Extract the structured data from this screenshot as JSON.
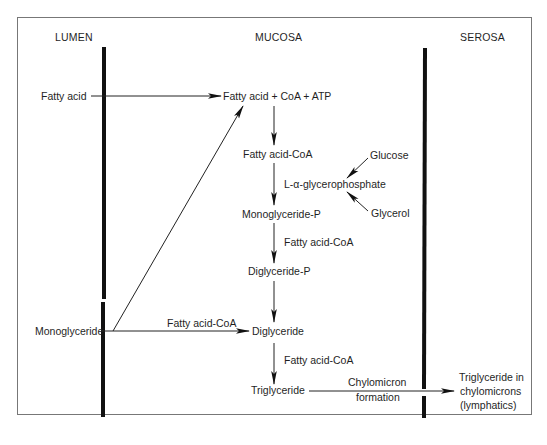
{
  "diagram": {
    "compartments": {
      "lumen": "LUMEN",
      "mucosa": "MUCOSA",
      "serosa": "SEROSA"
    },
    "nodes": {
      "fatty_acid_lumen": "Fatty acid",
      "monoglyceride_lumen": "Monoglyceride",
      "activation": "Fatty acid + CoA + ATP",
      "fatty_acid_coa": "Fatty acid-CoA",
      "glycerophosphate": "L-α-glycerophosphate",
      "glucose": "Glucose",
      "glycerol": "Glycerol",
      "monoglyceride_p": "Monoglyceride-P",
      "diglyceride_p": "Diglyceride-P",
      "diglyceride": "Diglyceride",
      "triglyceride": "Triglyceride",
      "triglyceride_chylo_1": "Triglyceride in",
      "triglyceride_chylo_2": "chylomicrons",
      "triglyceride_chylo_3": "(lymphatics)"
    },
    "edge_labels": {
      "mgp_to_dgp": "Fatty acid-CoA",
      "mg_to_dg": "Fatty acid-CoA",
      "dg_to_tg": "Fatty acid-CoA",
      "chylo_1": "Chylomicron",
      "chylo_2": "formation"
    },
    "edges": [
      {
        "from": "Fatty acid",
        "to": "Fatty acid + CoA + ATP"
      },
      {
        "from": "Monoglyceride",
        "to": "Fatty acid + CoA + ATP"
      },
      {
        "from": "Fatty acid + CoA + ATP",
        "to": "Fatty acid-CoA"
      },
      {
        "from": "Fatty acid-CoA",
        "to": "Monoglyceride-P"
      },
      {
        "from": "Glucose",
        "to": "L-α-glycerophosphate"
      },
      {
        "from": "Glycerol",
        "to": "L-α-glycerophosphate"
      },
      {
        "from": "Monoglyceride-P",
        "to": "Diglyceride-P",
        "label": "Fatty acid-CoA"
      },
      {
        "from": "Diglyceride-P",
        "to": "Diglyceride"
      },
      {
        "from": "Monoglyceride",
        "to": "Diglyceride",
        "label": "Fatty acid-CoA"
      },
      {
        "from": "Diglyceride",
        "to": "Triglyceride",
        "label": "Fatty acid-CoA"
      },
      {
        "from": "Triglyceride",
        "to": "Triglyceride in chylomicrons (lymphatics)",
        "label": "Chylomicron formation"
      }
    ]
  }
}
